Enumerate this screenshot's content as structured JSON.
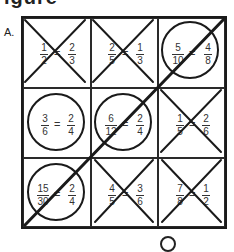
{
  "heading": "igure",
  "part_label": "A.",
  "grid": {
    "rows": 3,
    "cols": 3,
    "cells": [
      {
        "row": 0,
        "col": 0,
        "left": {
          "num": "1",
          "den": "2"
        },
        "op": "=",
        "right": {
          "num": "2",
          "den": "3"
        },
        "mark": "X"
      },
      {
        "row": 0,
        "col": 1,
        "left": {
          "num": "2",
          "den": "5"
        },
        "op": "=",
        "right": {
          "num": "1",
          "den": "3"
        },
        "mark": "X"
      },
      {
        "row": 0,
        "col": 2,
        "left": {
          "num": "5",
          "den": "10"
        },
        "op": "=",
        "right": {
          "num": "4",
          "den": "8"
        },
        "mark": "O"
      },
      {
        "row": 1,
        "col": 0,
        "left": {
          "num": "3",
          "den": "6"
        },
        "op": "=",
        "right": {
          "num": "2",
          "den": "4"
        },
        "mark": "O"
      },
      {
        "row": 1,
        "col": 1,
        "left": {
          "num": "6",
          "den": "12"
        },
        "op": "=",
        "right": {
          "num": "2",
          "den": "4"
        },
        "mark": "O"
      },
      {
        "row": 1,
        "col": 2,
        "left": {
          "num": "1",
          "den": "5"
        },
        "op": "=",
        "right": {
          "num": "2",
          "den": "6"
        },
        "mark": "X"
      },
      {
        "row": 2,
        "col": 0,
        "left": {
          "num": "15",
          "den": "30"
        },
        "op": "=",
        "right": {
          "num": "2",
          "den": "4"
        },
        "mark": "O"
      },
      {
        "row": 2,
        "col": 1,
        "left": {
          "num": "4",
          "den": "5"
        },
        "op": "=",
        "right": {
          "num": "3",
          "den": "6"
        },
        "mark": "X"
      },
      {
        "row": 2,
        "col": 2,
        "left": {
          "num": "7",
          "den": "8"
        },
        "op": "=",
        "right": {
          "num": "1",
          "den": "2"
        },
        "mark": "X"
      }
    ],
    "winning_line": "diagonal bottom-left to top-right"
  },
  "colors": {
    "ink": "#1a1a1a",
    "background": "#ffffff"
  }
}
